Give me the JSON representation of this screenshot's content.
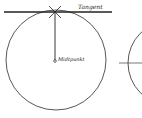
{
  "diagram": {
    "labels": {
      "tangent": "Tangent",
      "center": "Midtpunkt"
    },
    "colors": {
      "line": "#222222",
      "circle": "#444444",
      "background": "#ffffff"
    }
  }
}
